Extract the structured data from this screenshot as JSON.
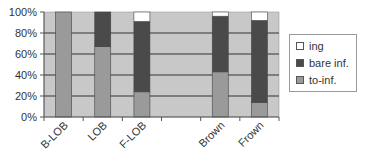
{
  "chart_data": {
    "type": "bar",
    "stacked": true,
    "percent": true,
    "title": "",
    "xlabel": "",
    "ylabel": "",
    "ylim": [
      0,
      100
    ],
    "yticks": [
      "0%",
      "20%",
      "40%",
      "60%",
      "80%",
      "100%"
    ],
    "categories": [
      "B-LOB",
      "LOB",
      "F-LOB",
      "",
      "Brown",
      "Frown"
    ],
    "series": [
      {
        "name": "to-inf.",
        "color": "#9a9a9a",
        "values": [
          100,
          67,
          24,
          null,
          43,
          14
        ]
      },
      {
        "name": "bare inf.",
        "color": "#4a4a4a",
        "values": [
          0,
          33,
          67,
          null,
          53,
          78
        ]
      },
      {
        "name": "ing",
        "color": "#ffffff",
        "values": [
          0,
          0,
          9,
          null,
          4,
          8
        ]
      }
    ],
    "grid": true,
    "plot_background": "#c8c8c8",
    "legend_position": "right",
    "legend": [
      "ing",
      "bare inf.",
      "to-inf."
    ]
  },
  "legend": {
    "items": [
      {
        "label": "ing",
        "color": "#ffffff"
      },
      {
        "label": "bare inf.",
        "color": "#4a4a4a"
      },
      {
        "label": "to-inf.",
        "color": "#9a9a9a"
      }
    ]
  }
}
